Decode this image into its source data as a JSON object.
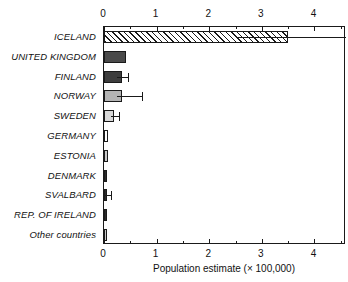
{
  "chart_data": {
    "type": "bar",
    "orientation": "horizontal",
    "title": "",
    "xlabel": "Population estimate (× 100,000)",
    "ylabel": "",
    "xlim": [
      0,
      4.6
    ],
    "xticks": [
      0,
      1,
      2,
      3,
      4
    ],
    "xtick_labels": [
      "0",
      "1",
      "2",
      "3",
      "4"
    ],
    "minor_tick_step": 0.5,
    "grid": false,
    "legend": "none",
    "axis_top": true,
    "axis_bottom": true,
    "categories": [
      "ICELAND",
      "UNITED KINGDOM",
      "FINLAND",
      "NORWAY",
      "SWEDEN",
      "GERMANY",
      "ESTONIA",
      "DENMARK",
      "SVALBARD",
      "REP. OF IRELAND",
      "Other countries"
    ],
    "values": [
      3.5,
      0.42,
      0.34,
      0.34,
      0.19,
      0.08,
      0.08,
      0.06,
      0.03,
      0.02,
      0.02
    ],
    "errors_high": [
      4.6,
      null,
      0.46,
      0.72,
      0.28,
      null,
      null,
      null,
      0.13,
      null,
      null
    ],
    "fills": [
      "hatch",
      "darkgray",
      "midgray",
      "lightgray",
      "paleg",
      "white",
      "cool",
      "black",
      "black",
      "black",
      "cool"
    ],
    "fill_colors": {
      "hatch": "#ffffff",
      "darkgray": "#4a4a4a",
      "midgray": "#3d3d3d",
      "lightgray": "#b4b4b4",
      "paleg": "#d8d8d8",
      "white": "#fdfdfd",
      "cool": "#c9c9c9",
      "black": "#2b2b2b"
    },
    "outline_color": "#1a1a1a",
    "background": "#ffffff"
  }
}
